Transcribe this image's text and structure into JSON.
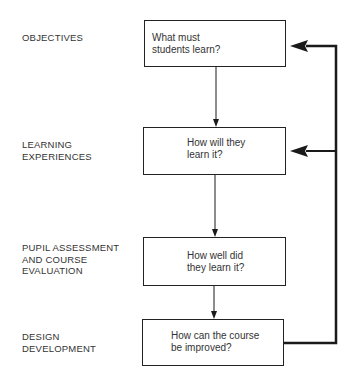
{
  "stages": [
    {
      "label_lines": [
        "OBJECTIVES"
      ],
      "question_lines": [
        "What must",
        "students learn?"
      ]
    },
    {
      "label_lines": [
        "LEARNING",
        "EXPERIENCES"
      ],
      "question_lines": [
        "How will they",
        "learn it?"
      ]
    },
    {
      "label_lines": [
        "PUPIL ASSESSMENT",
        "AND COURSE",
        "EVALUATION"
      ],
      "question_lines": [
        "How well did",
        "they learn it?"
      ]
    },
    {
      "label_lines": [
        "DESIGN",
        "DEVELOPMENT"
      ],
      "question_lines": [
        "How can the course",
        "be improved?"
      ]
    }
  ],
  "connections": [
    {
      "from": "stage-1",
      "to": "stage-2",
      "type": "arrow-down"
    },
    {
      "from": "stage-2",
      "to": "stage-3",
      "type": "arrow-down"
    },
    {
      "from": "stage-3",
      "to": "stage-4",
      "type": "arrow-down"
    },
    {
      "from": "stage-4",
      "to": "stage-1",
      "type": "feedback-loop"
    },
    {
      "from": "stage-4",
      "to": "stage-2",
      "type": "feedback-loop"
    }
  ],
  "colors": {
    "line": "#1a1a1a",
    "text": "#333333",
    "background": "#ffffff"
  }
}
